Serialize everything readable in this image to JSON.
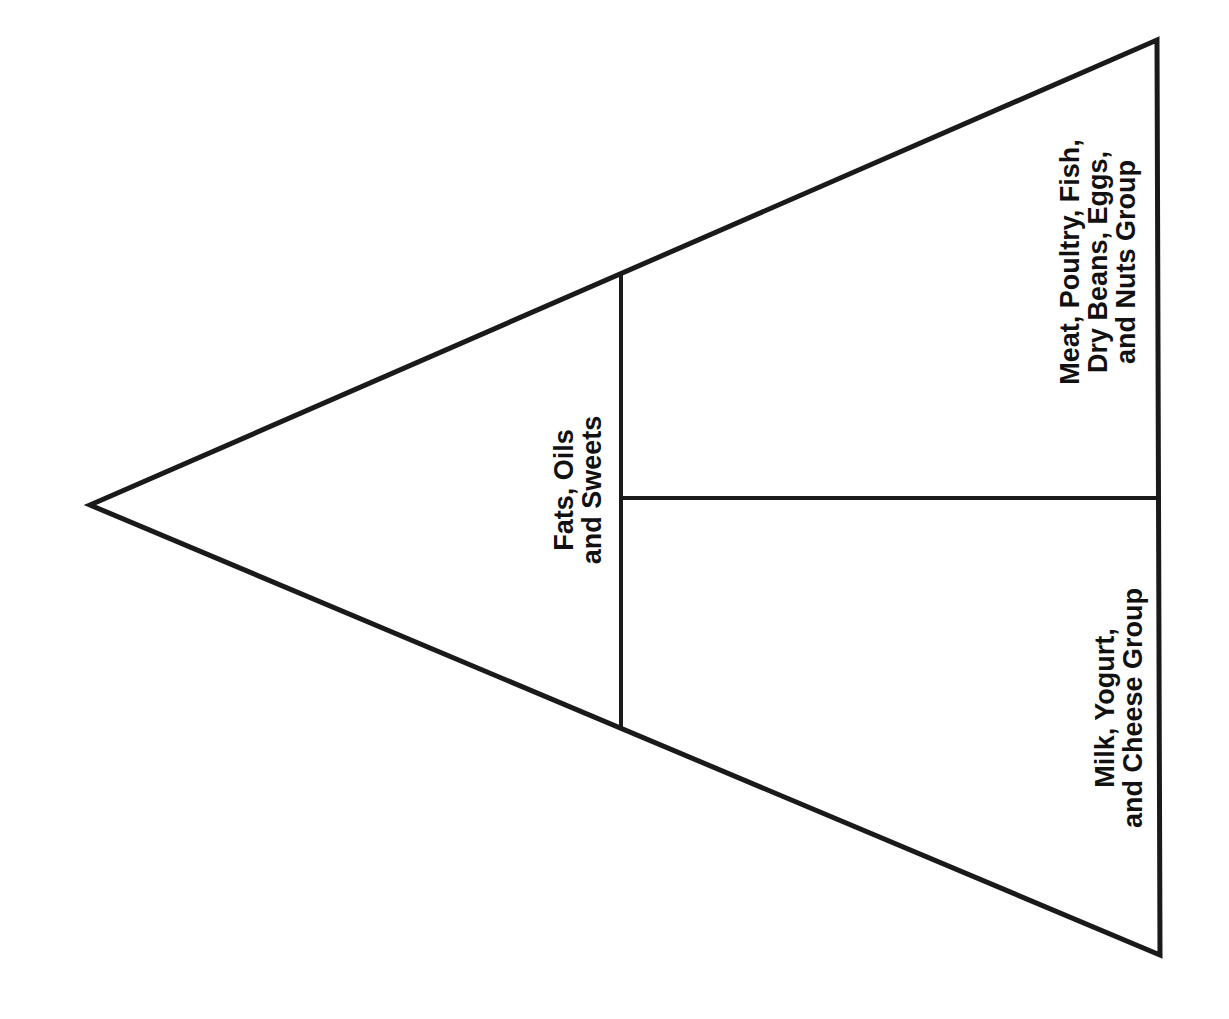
{
  "diagram": {
    "type": "food-guide-pyramid-outline",
    "orientation": "rotated-90-ccw",
    "stroke_color": "#1a1a1a",
    "background_color": "#ffffff",
    "sections": [
      {
        "id": "fats",
        "label": "Fats, Oils\nand Sweets"
      },
      {
        "id": "meat",
        "label": "Meat, Poultry, Fish,\nDry Beans, Eggs,\nand Nuts Group"
      },
      {
        "id": "milk",
        "label": "Milk, Yogurt,\nand Cheese Group"
      }
    ]
  }
}
